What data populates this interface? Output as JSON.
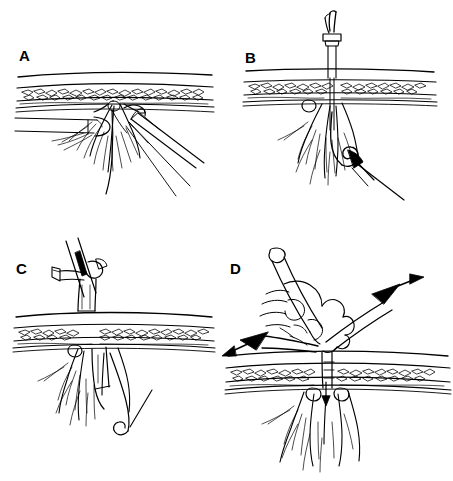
{
  "figure": {
    "background_color": "#ffffff",
    "ink_color": "#000000",
    "style": "black-and-white pen-and-ink line drawing",
    "width": 453,
    "height": 481,
    "panel_count": 4
  },
  "panels": [
    {
      "id": "a",
      "label": "A",
      "caption": "Grasper from the left and a needle holder from the lower right retract the tissue pedicle beneath the abdominal wall",
      "anatomy": [
        "skin line",
        "subcutaneous fat layer",
        "fascia",
        "peritoneum",
        "tissue pedicle with fibers"
      ],
      "instruments": [
        "laparoscopic grasper",
        "needle driver",
        "suture strand"
      ]
    },
    {
      "id": "b",
      "label": "B",
      "caption": "Suture passer is advanced through the abdominal wall and the suture loop is retrieved",
      "anatomy": [
        "skin line",
        "subcutaneous fat layer",
        "fascia",
        "peritoneum",
        "tissue pedicle with fibers"
      ],
      "instruments": [
        "suture passer with hub",
        "suture loop",
        "curled suture end",
        "grasper tip"
      ]
    },
    {
      "id": "c",
      "label": "C",
      "caption": "Trocar cannula with side port and valve is seated through the abdominal wall",
      "anatomy": [
        "skin line",
        "subcutaneous fat layer",
        "fascia",
        "peritoneum",
        "tissue pedicle with fibers"
      ],
      "instruments": [
        "trocar cannula",
        "side port stopcock",
        "valve housing",
        "obturator shaft"
      ]
    },
    {
      "id": "d",
      "label": "D",
      "caption": "Suture ends are drawn in opposite directions and the knot is tied down onto the fascia",
      "anatomy": [
        "skin line",
        "subcutaneous fat layer",
        "fascia",
        "peritoneum",
        "tissue pedicle with fibers"
      ],
      "instruments": [
        "hand gripping cannula",
        "suture limb left",
        "suture limb right",
        "traction arrows"
      ],
      "arrows": [
        "leftward traction arrow",
        "rightward traction arrow",
        "downward arrow at fascia"
      ]
    }
  ],
  "colors": {
    "ink": "#000000",
    "paper": "#ffffff",
    "fat_stipple": "#1a1a1a"
  }
}
